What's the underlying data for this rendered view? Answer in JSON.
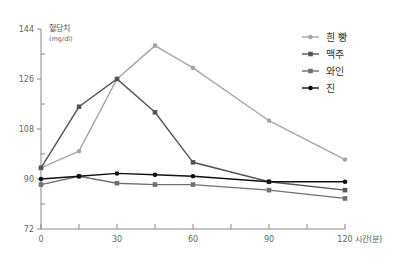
{
  "chart_data": {
    "type": "line",
    "title": "",
    "ylabel": "혈당치",
    "ylabel_unit": "(mg/dl)",
    "xlabel": "시간(분)",
    "x": [
      0,
      15,
      30,
      45,
      60,
      90,
      120
    ],
    "x_ticks": [
      0,
      30,
      60,
      90,
      120
    ],
    "x_minor_ticks": [
      15,
      45,
      75,
      105
    ],
    "y_ticks": [
      72,
      90,
      108,
      126,
      144
    ],
    "y_minor_ticks": [
      81,
      99,
      117,
      135
    ],
    "xlim": [
      0,
      120
    ],
    "ylim": [
      72,
      144
    ],
    "grid": false,
    "legend_position": "top-right",
    "series": [
      {
        "name": "흰 빵",
        "marker": "circle",
        "color": "#a6a6a6",
        "values": [
          94,
          100,
          126,
          138,
          130,
          111,
          97
        ]
      },
      {
        "name": "맥주",
        "marker": "square",
        "color": "#555555",
        "values": [
          94,
          116,
          126,
          114,
          96,
          89,
          86
        ]
      },
      {
        "name": "와인",
        "marker": "square",
        "color": "#707070",
        "values": [
          88,
          91,
          88.5,
          88,
          88,
          86,
          83
        ]
      },
      {
        "name": "진",
        "marker": "circle",
        "color": "#111111",
        "values": [
          90,
          91,
          92,
          91.5,
          91,
          89,
          89
        ]
      }
    ]
  }
}
